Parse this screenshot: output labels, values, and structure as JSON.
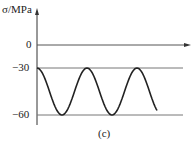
{
  "chart_data": {
    "type": "line",
    "title": "",
    "ylabel": "σ/MPa",
    "xlabel": "",
    "yticks": [
      "0",
      "−30",
      "−60"
    ],
    "ylim": [
      -60,
      0
    ],
    "reference_lines": [
      0,
      -30,
      -60
    ],
    "series": [
      {
        "name": "stress",
        "form": "sinusoid",
        "max": -30,
        "min": -60,
        "mean": -45,
        "amplitude": 15,
        "cycles_shown": 2.6
      }
    ],
    "caption": "(c)"
  },
  "labels": {
    "ylabel": "σ/MPa",
    "zero": "0",
    "m30": "−30",
    "m60": "−60",
    "caption": "(c)"
  }
}
